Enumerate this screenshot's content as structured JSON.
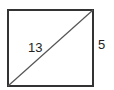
{
  "diagram": {
    "shape": "rectangle",
    "diagonal_label": "13",
    "side_label": "5",
    "colors": {
      "border": "#333333",
      "diagonal": "#555555",
      "text": "#222222"
    }
  }
}
